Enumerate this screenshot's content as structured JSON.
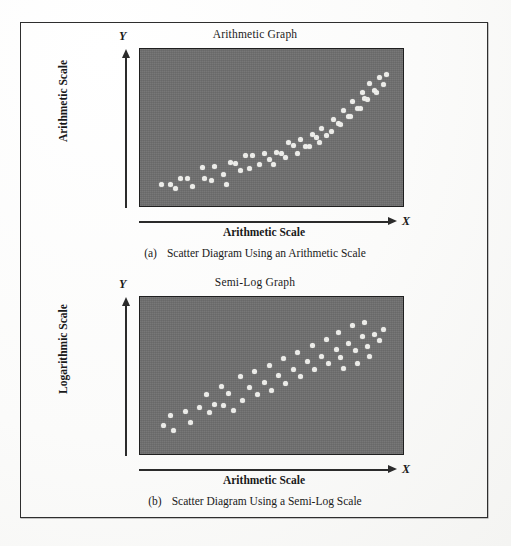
{
  "page": {
    "background_color": "#ffffff",
    "border_color": "#2e2e2e",
    "plot_fill_color": "#6e6e6e",
    "dot_color": "#f2f2ee"
  },
  "figures": [
    {
      "id": "a",
      "title": "Arithmetic Graph",
      "y_axis_letter": "Y",
      "y_axis_label": "Arithmetic Scale",
      "x_axis_letter": "X",
      "x_axis_label": "Arithmetic Scale",
      "caption_tag": "(a)",
      "caption_text": "Scatter Diagram Using an Arithmetic Scale"
    },
    {
      "id": "b",
      "title": "Semi-Log Graph",
      "y_axis_letter": "Y",
      "y_axis_label": "Logarithmic Scale",
      "x_axis_letter": "X",
      "x_axis_label": "Arithmetic Scale",
      "caption_tag": "(b)",
      "caption_text": "Scatter Diagram Using a Semi-Log Scale"
    }
  ],
  "chart_data": [
    {
      "type": "scatter",
      "title": "Arithmetic Graph",
      "xlabel": "Arithmetic Scale",
      "ylabel": "Arithmetic Scale",
      "xlim": [
        0,
        100
      ],
      "ylim": [
        0,
        100
      ],
      "grid": false,
      "legend": "none",
      "axis_ticks": "none",
      "note": "Upward-curving (convex / exponential-looking) cloud of points on an arithmetic y-scale",
      "points": [
        [
          4,
          9
        ],
        [
          8,
          9
        ],
        [
          12,
          13
        ],
        [
          15,
          13
        ],
        [
          10,
          6
        ],
        [
          17,
          7
        ],
        [
          22,
          13
        ],
        [
          21,
          21
        ],
        [
          26,
          22
        ],
        [
          25,
          12
        ],
        [
          30,
          16
        ],
        [
          33,
          25
        ],
        [
          35,
          24
        ],
        [
          37,
          19
        ],
        [
          31,
          9
        ],
        [
          39,
          30
        ],
        [
          42,
          30
        ],
        [
          41,
          20
        ],
        [
          45,
          23
        ],
        [
          47,
          31
        ],
        [
          49,
          27
        ],
        [
          52,
          32
        ],
        [
          54,
          31
        ],
        [
          51,
          23
        ],
        [
          57,
          39
        ],
        [
          59,
          37
        ],
        [
          56,
          28
        ],
        [
          62,
          41
        ],
        [
          64,
          36
        ],
        [
          61,
          31
        ],
        [
          67,
          45
        ],
        [
          69,
          43
        ],
        [
          66,
          36
        ],
        [
          71,
          49
        ],
        [
          73,
          44
        ],
        [
          70,
          39
        ],
        [
          76,
          56
        ],
        [
          78,
          53
        ],
        [
          75,
          47
        ],
        [
          80,
          62
        ],
        [
          82,
          58
        ],
        [
          79,
          52
        ],
        [
          84,
          69
        ],
        [
          86,
          64
        ],
        [
          83,
          58
        ],
        [
          88,
          75
        ],
        [
          90,
          70
        ],
        [
          87,
          64
        ],
        [
          91,
          82
        ],
        [
          93,
          77
        ],
        [
          89,
          71
        ],
        [
          95,
          86
        ],
        [
          97,
          81
        ],
        [
          94,
          75
        ],
        [
          98,
          88
        ]
      ]
    },
    {
      "type": "scatter",
      "title": "Semi-Log Graph",
      "xlabel": "Arithmetic Scale",
      "ylabel": "Logarithmic Scale",
      "xlim": [
        0,
        100
      ],
      "ylim": [
        0,
        100
      ],
      "grid": false,
      "legend": "none",
      "axis_ticks": "none",
      "note": "Same data plotted on a logarithmic y-scale, producing a roughly straight-line upward band",
      "points": [
        [
          5,
          14
        ],
        [
          9,
          10
        ],
        [
          8,
          21
        ],
        [
          16,
          16
        ],
        [
          14,
          24
        ],
        [
          20,
          27
        ],
        [
          24,
          23
        ],
        [
          26,
          29
        ],
        [
          23,
          36
        ],
        [
          30,
          28
        ],
        [
          34,
          25
        ],
        [
          32,
          37
        ],
        [
          29,
          42
        ],
        [
          38,
          32
        ],
        [
          41,
          41
        ],
        [
          37,
          49
        ],
        [
          44,
          36
        ],
        [
          47,
          45
        ],
        [
          43,
          53
        ],
        [
          50,
          39
        ],
        [
          53,
          50
        ],
        [
          49,
          57
        ],
        [
          56,
          44
        ],
        [
          59,
          54
        ],
        [
          55,
          62
        ],
        [
          62,
          49
        ],
        [
          65,
          60
        ],
        [
          61,
          67
        ],
        [
          68,
          54
        ],
        [
          71,
          64
        ],
        [
          67,
          72
        ],
        [
          74,
          59
        ],
        [
          77,
          69
        ],
        [
          73,
          76
        ],
        [
          79,
          63
        ],
        [
          82,
          73
        ],
        [
          78,
          81
        ],
        [
          85,
          68
        ],
        [
          88,
          78
        ],
        [
          84,
          86
        ],
        [
          90,
          71
        ],
        [
          93,
          80
        ],
        [
          89,
          88
        ],
        [
          95,
          75
        ],
        [
          97,
          83
        ],
        [
          91,
          64
        ],
        [
          86,
          59
        ],
        [
          80,
          55
        ]
      ]
    }
  ]
}
